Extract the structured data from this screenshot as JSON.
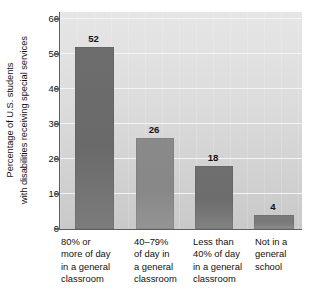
{
  "chart_data": {
    "type": "bar",
    "title": "",
    "xlabel": "",
    "ylabel": "Percentage of U.S. students with disabilities receiving special services",
    "ylabel_lines": [
      "Percentage of U.S. students",
      "with disabilities receiving special services"
    ],
    "categories": [
      "80% or more of day in a general classroom",
      "40–79% of day in a general classroom",
      "Less than 40% of day in a general classroom",
      "Not in a general school"
    ],
    "category_lines": [
      [
        "80% or",
        "more of day",
        "in a general",
        "classroom"
      ],
      [
        "40–79%",
        "of day in",
        "a general",
        "classroom"
      ],
      [
        "Less than",
        "40% of day",
        "in a general",
        "classroom"
      ],
      [
        "Not in a",
        "general",
        "school"
      ]
    ],
    "values": [
      52,
      26,
      18,
      4
    ],
    "value_labels": [
      "52",
      "26",
      "18",
      "4"
    ],
    "ylim": [
      0,
      62
    ],
    "yticks": [
      0,
      10,
      20,
      30,
      40,
      50,
      60
    ],
    "ytick_labels": [
      "0",
      "10",
      "20",
      "30",
      "40",
      "50",
      "60"
    ],
    "grid": "horizontal",
    "legend": "none",
    "colors": {
      "bar": "#6d6d6d",
      "bar_light": "#8a8a8a",
      "plot_background": "#dcdcdc",
      "gridline": "#f4f4f4",
      "axis": "#5e5e5e",
      "text": "#111111",
      "page_background": "#ffffff"
    }
  }
}
